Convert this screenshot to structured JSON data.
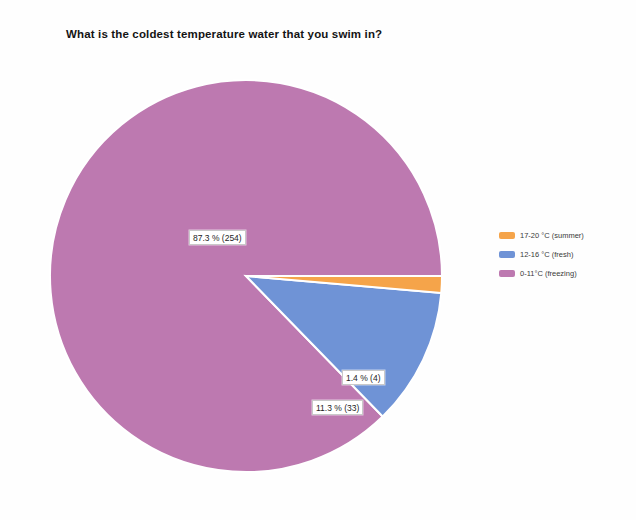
{
  "chart_data": {
    "type": "pie",
    "title": "What is the coldest temperature water that you swim in?",
    "xlabel": "",
    "ylabel": "",
    "total": 291,
    "legend_position": "right",
    "grid": false,
    "categories": [
      "17-20 °C (summer)",
      "12-16 °C (fresh)",
      "0-11°C (freezing)"
    ],
    "values": [
      4,
      33,
      254
    ],
    "percentages": [
      1.4,
      11.3,
      87.3
    ],
    "colors": [
      "#f5a44a",
      "#6f93d6",
      "#bd79b0"
    ],
    "data_labels": [
      "1.4 % (4)",
      "11.3 % (33)",
      "87.3 % (254)"
    ],
    "slices": [
      {
        "label": "17-20 °C (summer)",
        "value": 4,
        "percent": 1.4,
        "data_label": "1.4 % (4)",
        "color": "#f5a44a",
        "start_angle_deg": 0,
        "end_angle_deg": 5.04
      },
      {
        "label": "12-16 °C (fresh)",
        "value": 33,
        "percent": 11.3,
        "data_label": "11.3 % (33)",
        "color": "#6f93d6",
        "start_angle_deg": 5.04,
        "end_angle_deg": 45.72
      },
      {
        "label": "0-11°C (freezing)",
        "value": 254,
        "percent": 87.3,
        "data_label": "87.3 % (254)",
        "color": "#bd79b0",
        "start_angle_deg": 45.72,
        "end_angle_deg": 360
      }
    ]
  },
  "title": {
    "text": "What is the coldest temperature water that you swim in?"
  },
  "labels": {
    "freezing": "87.3 % (254)",
    "summer": "1.4 % (4)",
    "fresh": "11.3 % (33)"
  },
  "legend": {
    "items": [
      {
        "label": "17-20 °C (summer)",
        "color": "#f5a44a"
      },
      {
        "label": "12-16 °C (fresh)",
        "color": "#6f93d6"
      },
      {
        "label": "0-11°C (freezing)",
        "color": "#bd79b0"
      }
    ]
  }
}
